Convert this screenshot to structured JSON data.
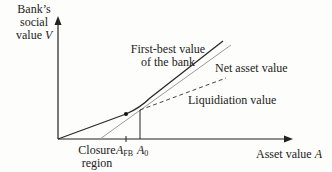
{
  "diagram": {
    "y_axis": {
      "label_line1": "Bank’s",
      "label_line2": "social",
      "label_line3_prefix": "value ",
      "label_var": "V"
    },
    "x_axis": {
      "label_prefix": "Asset value ",
      "label_var": "A"
    },
    "curves": {
      "first_best": {
        "line1": "First-best value",
        "line2": "of the bank",
        "color": "#2a2a2a"
      },
      "net_asset": {
        "label": "Net asset value",
        "color": "#9a9a9a"
      },
      "liquidation": {
        "label": "Liquidiation value",
        "color": "#444444",
        "style": "dashed"
      }
    },
    "ticks": {
      "closure_line1": "Closure",
      "closure_line2": "region",
      "a_fb_var": "A",
      "a_fb_sub": "FB",
      "a0_var": "A",
      "a0_sub": "0"
    }
  }
}
